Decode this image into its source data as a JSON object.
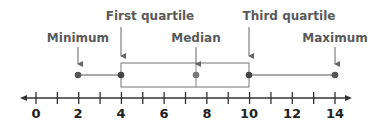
{
  "diagram": {
    "type": "box-plot",
    "labels": {
      "minimum": "Minimum",
      "first_quartile": "First quartile",
      "median": "Median",
      "third_quartile": "Third quartile",
      "maximum": "Maximum"
    },
    "axis": {
      "ticks": [
        "0",
        "2",
        "4",
        "6",
        "8",
        "10",
        "12",
        "14"
      ],
      "range": [
        0,
        14
      ],
      "minor_step": 1
    },
    "colors": {
      "label": "#5a5a5a",
      "line": "#333333",
      "dot": "#555555",
      "median_dot": "#777777",
      "box": "#777777"
    }
  },
  "chart_data": {
    "type": "box",
    "title": "",
    "min": 2,
    "q1": 4,
    "median": 7.5,
    "q3": 10,
    "max": 14,
    "xlim": [
      0,
      14
    ],
    "tick_labels": [
      "0",
      "2",
      "4",
      "6",
      "8",
      "10",
      "12",
      "14"
    ],
    "annotations": [
      "Minimum",
      "First quartile",
      "Median",
      "Third quartile",
      "Maximum"
    ]
  }
}
